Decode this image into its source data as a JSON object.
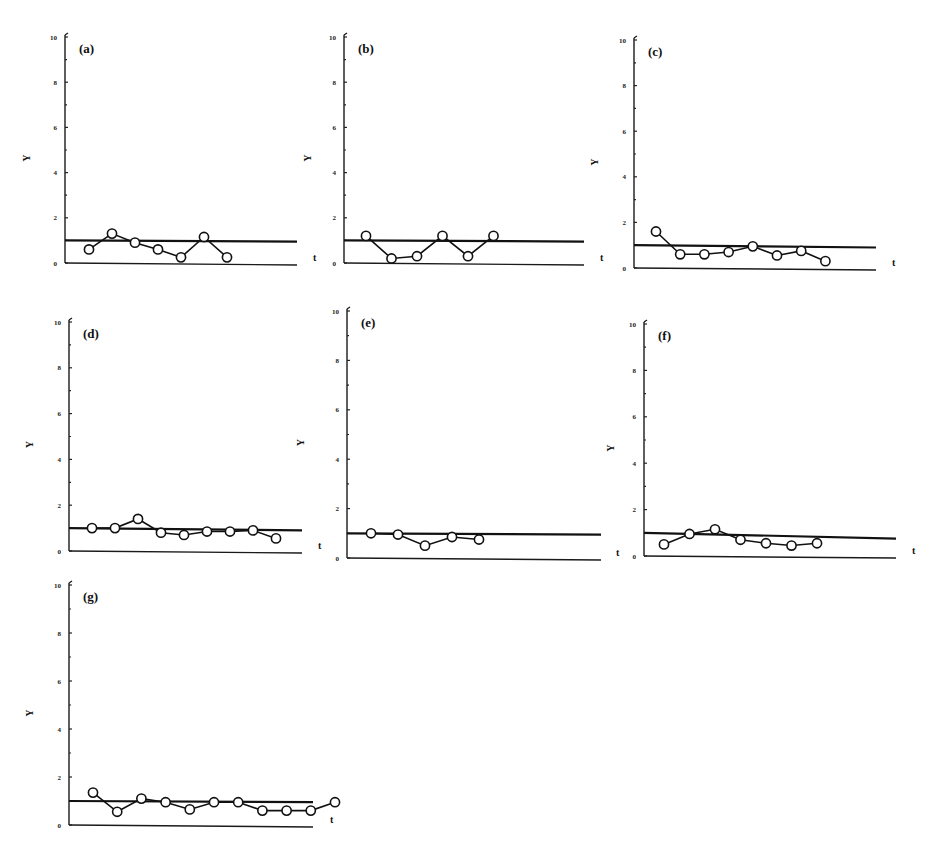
{
  "figure": {
    "y_axis_label": "Y",
    "x_axis_label": "t"
  },
  "chart_data": [
    {
      "type": "line",
      "panel": "(a)",
      "ylabel": "Y",
      "xlabel": "t",
      "ylim": [
        0,
        10
      ],
      "yticks": [
        0,
        2,
        4,
        6,
        8,
        10
      ],
      "reference_line": {
        "start": 1.0,
        "end": 0.95
      },
      "x": [
        1,
        2,
        3,
        4,
        5,
        6,
        7
      ],
      "values": [
        0.6,
        1.3,
        0.9,
        0.6,
        0.25,
        1.15,
        0.25
      ]
    },
    {
      "type": "line",
      "panel": "(b)",
      "ylabel": "Y",
      "xlabel": "t",
      "ylim": [
        0,
        10
      ],
      "yticks": [
        0,
        2,
        4,
        6,
        8,
        10
      ],
      "reference_line": {
        "start": 1.0,
        "end": 0.95
      },
      "x": [
        1,
        2,
        3,
        4,
        5,
        6
      ],
      "values": [
        1.2,
        0.2,
        0.3,
        1.2,
        0.3,
        1.2
      ]
    },
    {
      "type": "line",
      "panel": "(c)",
      "ylabel": "Y",
      "xlabel": "t",
      "ylim": [
        0,
        10
      ],
      "yticks": [
        0,
        2,
        4,
        6,
        8,
        10
      ],
      "reference_line": {
        "start": 1.0,
        "end": 0.9
      },
      "x": [
        1,
        2,
        3,
        4,
        5,
        6,
        7,
        8
      ],
      "values": [
        1.6,
        0.6,
        0.6,
        0.7,
        0.95,
        0.55,
        0.75,
        0.3
      ]
    },
    {
      "type": "line",
      "panel": "(d)",
      "ylabel": "Y",
      "xlabel": "t",
      "ylim": [
        0,
        10
      ],
      "yticks": [
        0,
        2,
        4,
        6,
        8,
        10
      ],
      "reference_line": {
        "start": 1.0,
        "end": 0.9
      },
      "x": [
        1,
        2,
        3,
        4,
        5,
        6,
        7,
        8,
        9
      ],
      "values": [
        1.0,
        1.0,
        1.4,
        0.8,
        0.7,
        0.85,
        0.85,
        0.9,
        0.55
      ]
    },
    {
      "type": "line",
      "panel": "(e)",
      "ylabel": "Y",
      "xlabel": "t",
      "ylim": [
        0,
        10
      ],
      "yticks": [
        0,
        2,
        4,
        6,
        8,
        10
      ],
      "reference_line": {
        "start": 1.0,
        "end": 0.95
      },
      "x": [
        1,
        2,
        3,
        4,
        5
      ],
      "values": [
        1.0,
        0.95,
        0.5,
        0.85,
        0.75
      ]
    },
    {
      "type": "line",
      "panel": "(f)",
      "ylabel": "Y",
      "xlabel": "t",
      "ylim": [
        0,
        10
      ],
      "yticks": [
        0,
        2,
        4,
        6,
        8,
        10
      ],
      "reference_line": {
        "start": 1.0,
        "end": 0.75
      },
      "x": [
        1,
        2,
        3,
        4,
        5,
        6,
        7
      ],
      "values": [
        0.5,
        0.95,
        1.15,
        0.7,
        0.55,
        0.45,
        0.55
      ]
    },
    {
      "type": "line",
      "panel": "(g)",
      "ylabel": "Y",
      "xlabel": "t",
      "ylim": [
        0,
        10
      ],
      "yticks": [
        0,
        2,
        4,
        6,
        8,
        10
      ],
      "reference_line": {
        "start": 1.0,
        "end": 0.95
      },
      "x": [
        1,
        2,
        3,
        4,
        5,
        6,
        7,
        8,
        9,
        10,
        11
      ],
      "values": [
        1.35,
        0.55,
        1.1,
        0.95,
        0.65,
        0.95,
        0.95,
        0.6,
        0.6,
        0.6,
        0.95
      ]
    }
  ]
}
